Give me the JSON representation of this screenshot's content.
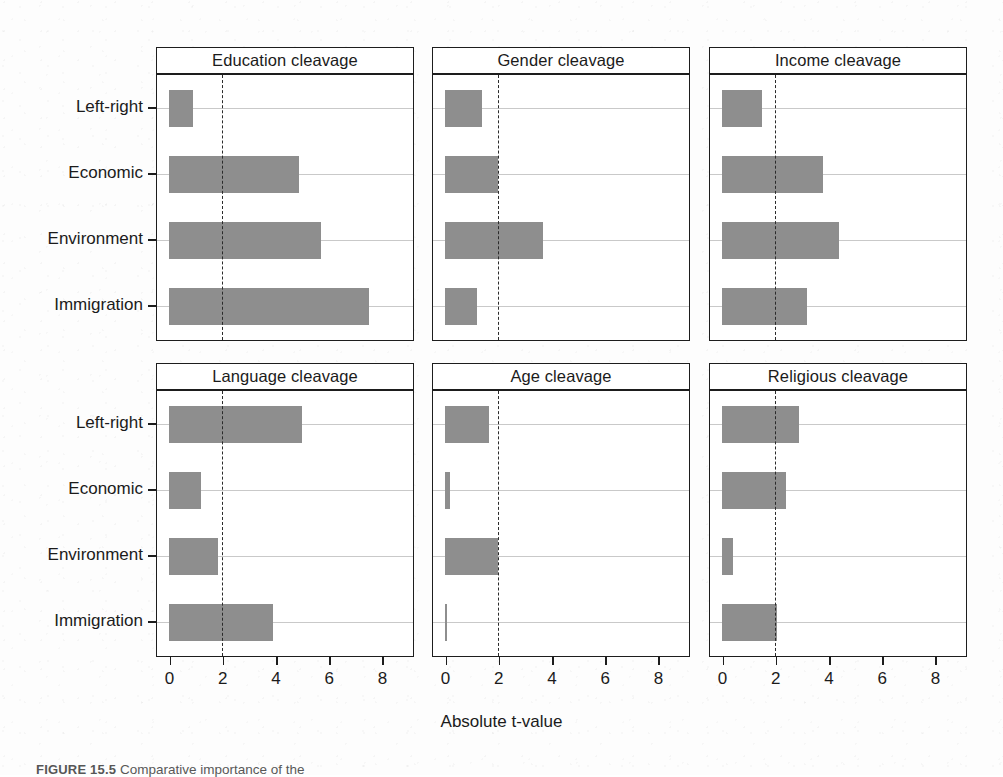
{
  "figure": {
    "xlabel": "Absolute t-value",
    "caption_prefix": "FIGURE 15.5",
    "caption_text": "Comparative importance of the ",
    "bar_color": "#8e8e8e",
    "threshold_value": 2,
    "axis_color": "#1d1d1d",
    "grid_color": "#c9c9c9"
  },
  "chart_data": {
    "type": "bar",
    "orientation": "horizontal",
    "title": "",
    "xlabel": "Absolute t-value",
    "ylabel": "",
    "xlim": [
      0,
      8.6
    ],
    "xticks": [
      0,
      2,
      4,
      6,
      8
    ],
    "xticklabels": [
      "0",
      "2",
      "4",
      "6",
      "8"
    ],
    "categories": [
      "Left-right",
      "Economic",
      "Environment",
      "Immigration"
    ],
    "grid": true,
    "legend": "none",
    "annotations": [
      {
        "type": "vline",
        "value": 2,
        "style": "dashed",
        "label": "significance threshold"
      }
    ],
    "panels": [
      {
        "title": "Education cleavage",
        "row": 0,
        "col": 0,
        "values": [
          0.9,
          4.9,
          5.7,
          7.5
        ]
      },
      {
        "title": "Gender cleavage",
        "row": 0,
        "col": 1,
        "values": [
          1.4,
          2.0,
          3.7,
          1.2
        ]
      },
      {
        "title": "Income cleavage",
        "row": 0,
        "col": 2,
        "values": [
          1.5,
          3.8,
          4.4,
          3.2
        ]
      },
      {
        "title": "Language cleavage",
        "row": 1,
        "col": 0,
        "values": [
          5.0,
          1.2,
          1.85,
          3.9
        ]
      },
      {
        "title": "Age cleavage",
        "row": 1,
        "col": 1,
        "values": [
          1.65,
          0.2,
          2.0,
          0.07
        ]
      },
      {
        "title": "Religious cleavage",
        "row": 1,
        "col": 2,
        "values": [
          2.9,
          2.4,
          0.4,
          2.05
        ]
      }
    ]
  }
}
